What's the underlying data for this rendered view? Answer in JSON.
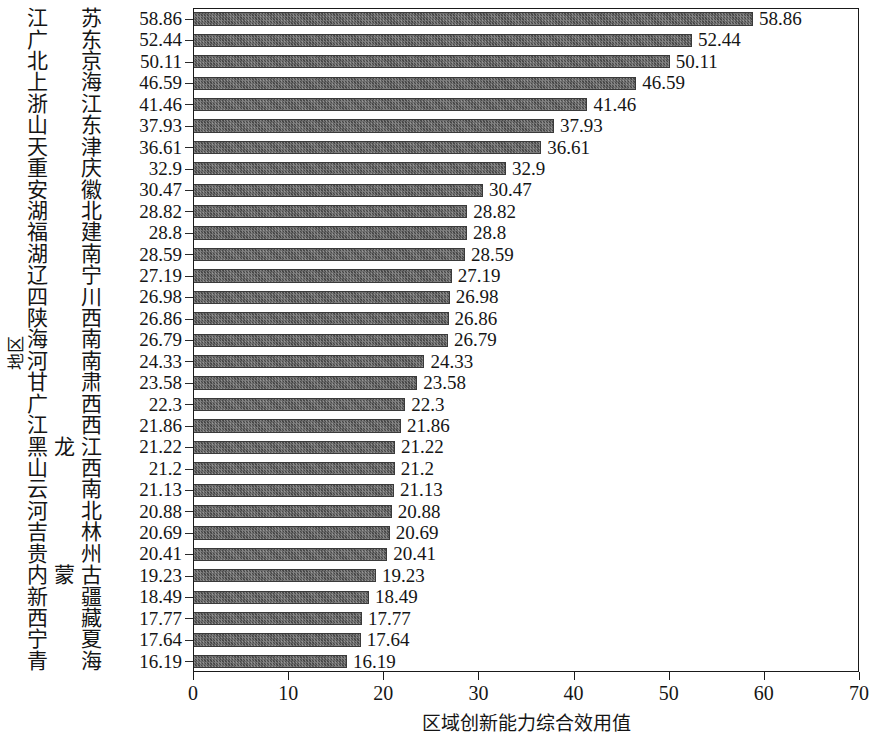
{
  "chart_data": {
    "type": "bar",
    "orientation": "horizontal",
    "title": "",
    "xlabel": "区域创新能力综合效用值",
    "ylabel": "地区",
    "xlim": [
      0,
      70
    ],
    "xticks": [
      0,
      10,
      20,
      30,
      40,
      50,
      60,
      70
    ],
    "grid": false,
    "legend": null,
    "bar_color": "#5c5c5c",
    "categories": [
      "江苏",
      "广东",
      "北京",
      "上海",
      "浙江",
      "山东",
      "天津",
      "重庆",
      "安徽",
      "湖北",
      "福建",
      "湖南",
      "辽宁",
      "四川",
      "陕西",
      "海南",
      "河南",
      "甘肃",
      "广西",
      "江西",
      "黑龙江",
      "山西",
      "云南",
      "河北",
      "吉林",
      "贵州",
      "内蒙古",
      "新疆",
      "西藏",
      "宁夏",
      "青海"
    ],
    "values": [
      58.86,
      52.44,
      50.11,
      46.59,
      41.46,
      37.93,
      36.61,
      32.9,
      30.47,
      28.82,
      28.8,
      28.59,
      27.19,
      26.98,
      26.86,
      26.79,
      24.33,
      23.58,
      22.3,
      21.86,
      21.22,
      21.2,
      21.13,
      20.88,
      20.69,
      20.41,
      19.23,
      18.49,
      17.77,
      17.64,
      16.19
    ],
    "value_labels": [
      "58.86",
      "52.44",
      "50.11",
      "46.59",
      "41.46",
      "37.93",
      "36.61",
      "32.9",
      "30.47",
      "28.82",
      "28.8",
      "28.59",
      "27.19",
      "26.98",
      "26.86",
      "26.79",
      "24.33",
      "23.58",
      "22.3",
      "21.86",
      "21.22",
      "21.2",
      "21.13",
      "20.88",
      "20.69",
      "20.41",
      "19.23",
      "18.49",
      "17.77",
      "17.64",
      "16.19"
    ],
    "xtick_labels": [
      "0",
      "10",
      "20",
      "30",
      "40",
      "50",
      "60",
      "70"
    ]
  }
}
